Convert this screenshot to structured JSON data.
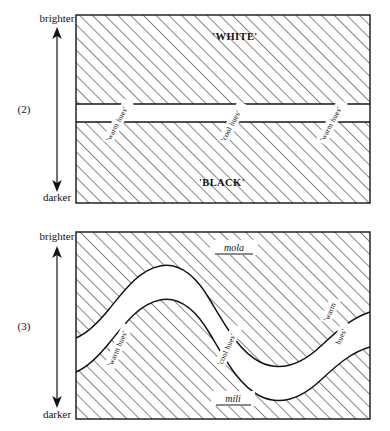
{
  "figure": {
    "panels": [
      {
        "number": "(2)",
        "axis": {
          "top": "brighter",
          "bottom": "darker",
          "arrow": "double-headed-vertical-arrow"
        },
        "zones": {
          "upper": "'WHITE'",
          "lower": "'BLACK'"
        },
        "hue_labels": [
          {
            "text": "'warm hues'",
            "position": "left"
          },
          {
            "text": "'cool hues'",
            "position": "center"
          },
          {
            "text": "'warm hues'",
            "position": "right"
          }
        ],
        "description": "Horizontal straight band separating an upper hatched 'WHITE' region from a lower hatched 'BLACK' region."
      },
      {
        "number": "(3)",
        "axis": {
          "top": "brighter",
          "bottom": "darker",
          "arrow": "double-headed-vertical-arrow"
        },
        "zones": {
          "upper": "mola",
          "lower": "mili"
        },
        "hue_labels": [
          {
            "text": "'warm hues'",
            "position": "left"
          },
          {
            "text": "'cool hues'",
            "position": "center"
          },
          {
            "text": "'warm",
            "position": "right-line1"
          },
          {
            "text": "hues'",
            "position": "right-line2"
          }
        ],
        "description": "Wavy S-curve band rising to a crest in the centre, separating an upper hatched region labelled mola from a lower hatched region labelled mili."
      }
    ],
    "colors": {
      "ink": "#141414",
      "hatch": "#2b2b2b",
      "background": "#ffffff"
    }
  }
}
